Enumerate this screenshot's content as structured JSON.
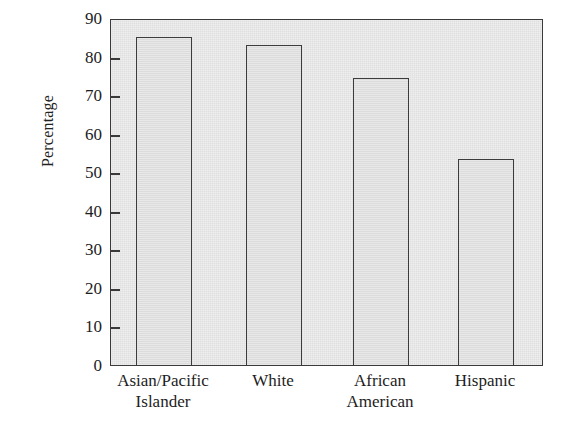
{
  "chart_data": {
    "type": "bar",
    "title": "",
    "subtitle": "",
    "xlabel": "",
    "ylabel": "Percentage",
    "ylim": [
      0,
      90
    ],
    "ytick_step": 10,
    "yticks": [
      "90",
      "80",
      "70",
      "60",
      "50",
      "40",
      "30",
      "20",
      "10",
      "0"
    ],
    "grid": false,
    "legend": null,
    "categories": [
      "Asian/Pacific Islander",
      "White",
      "African American",
      "Hispanic"
    ],
    "category_lines": [
      [
        "Asian/Pacific",
        "Islander"
      ],
      [
        "White",
        ""
      ],
      [
        "African",
        "American"
      ],
      [
        "Hispanic",
        ""
      ]
    ],
    "values": [
      85,
      83,
      74.5,
      53.5
    ],
    "colors": {
      "bar_fill": "#dcdcdc",
      "bar_stroke": "#3c3c3c",
      "plot_background": "#e3e3e3",
      "axis": "#3a3a3a",
      "text": "#1d1d1d",
      "page_background": "#ffffff"
    }
  }
}
